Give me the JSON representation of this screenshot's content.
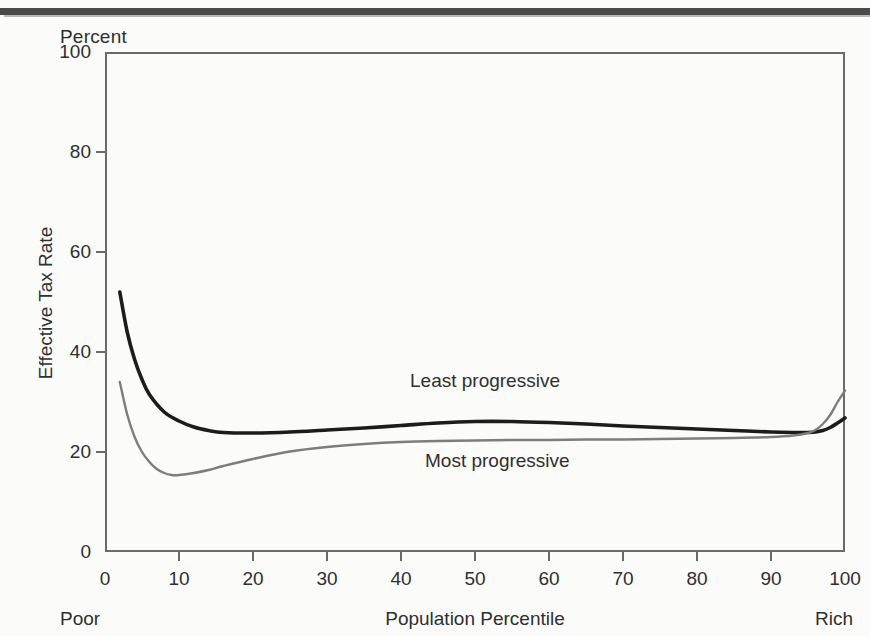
{
  "figure": {
    "top_rule": "horizontal-rule",
    "percent_label": "Percent",
    "y_axis_title": "Effective Tax Rate",
    "x_axis_title": "Population Percentile",
    "x_axis_left_cap": "Poor",
    "x_axis_right_cap": "Rich"
  },
  "colors": {
    "least_progressive": "#1c1c1c",
    "most_progressive": "#7d7d7d",
    "axis": "#6a6a6a",
    "text": "#2f2f2f",
    "background": "#fbfbfa",
    "top_rule": "#4a4a4a"
  },
  "chart_data": {
    "type": "line",
    "title": "",
    "subtitle": "",
    "xlabel": "Population Percentile",
    "ylabel": "Effective Tax Rate",
    "unit_label": "Percent",
    "xlim": [
      0,
      100
    ],
    "ylim": [
      0,
      100
    ],
    "xticks": [
      0,
      10,
      20,
      30,
      40,
      50,
      60,
      70,
      80,
      90,
      100
    ],
    "yticks": [
      0,
      20,
      40,
      60,
      80,
      100
    ],
    "xtick_labels": [
      "0",
      "10",
      "20",
      "30",
      "40",
      "50",
      "60",
      "70",
      "80",
      "90",
      "100"
    ],
    "ytick_labels": [
      "0",
      "20",
      "40",
      "60",
      "80",
      "100"
    ],
    "grid": false,
    "legend": "inline-annotations",
    "annotations": [
      {
        "text": "Least progressive",
        "x": 28,
        "y": 33
      },
      {
        "text": "Most progressive",
        "x": 30,
        "y": 18
      }
    ],
    "series": [
      {
        "name": "Least progressive",
        "color": "#1c1c1c",
        "width": 3.6,
        "x": [
          2,
          3,
          4,
          5,
          6,
          8,
          10,
          12,
          14,
          16,
          20,
          25,
          30,
          35,
          40,
          45,
          50,
          55,
          60,
          65,
          70,
          75,
          80,
          85,
          90,
          93,
          95,
          96,
          97,
          98,
          99,
          100
        ],
        "y": [
          52.0,
          44.0,
          38.5,
          34.5,
          31.5,
          28.0,
          26.2,
          25.0,
          24.3,
          23.9,
          23.8,
          24.0,
          24.4,
          24.8,
          25.3,
          25.8,
          26.1,
          26.1,
          25.9,
          25.6,
          25.2,
          24.9,
          24.6,
          24.3,
          24.0,
          23.9,
          23.9,
          24.0,
          24.3,
          24.9,
          25.8,
          26.8
        ]
      },
      {
        "name": "Most progressive",
        "color": "#7d7d7d",
        "width": 2.4,
        "x": [
          2,
          3,
          4,
          5,
          6,
          7,
          8,
          9,
          10,
          12,
          14,
          16,
          20,
          25,
          30,
          35,
          40,
          45,
          50,
          55,
          60,
          65,
          70,
          75,
          80,
          85,
          90,
          93,
          95,
          96,
          97,
          98,
          99,
          100
        ],
        "y": [
          34.0,
          27.5,
          23.0,
          20.0,
          18.0,
          16.6,
          15.8,
          15.4,
          15.4,
          15.8,
          16.4,
          17.2,
          18.6,
          20.1,
          21.0,
          21.6,
          22.0,
          22.2,
          22.3,
          22.4,
          22.4,
          22.5,
          22.5,
          22.6,
          22.7,
          22.8,
          23.0,
          23.3,
          23.8,
          24.4,
          25.6,
          27.4,
          30.0,
          32.3
        ]
      }
    ]
  }
}
